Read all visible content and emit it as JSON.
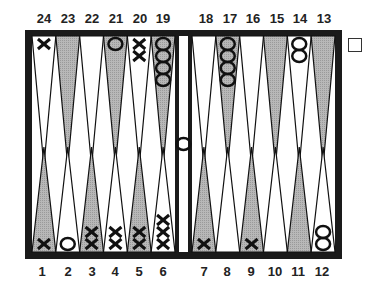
{
  "board": {
    "frame_color": "#1a1a1a",
    "shade_color": "#b8b8b8",
    "top_labels": [
      "24",
      "23",
      "22",
      "21",
      "20",
      "19",
      "18",
      "17",
      "16",
      "15",
      "14",
      "13"
    ],
    "bottom_labels": [
      "1",
      "2",
      "3",
      "4",
      "5",
      "6",
      "7",
      "8",
      "9",
      "10",
      "11",
      "12"
    ],
    "points": {
      "1": {
        "shade": "gray",
        "checker": "X",
        "count": 1
      },
      "2": {
        "shade": "white",
        "checker": "O",
        "count": 1
      },
      "3": {
        "shade": "gray",
        "checker": "X",
        "count": 2
      },
      "4": {
        "shade": "white",
        "checker": "X",
        "count": 2
      },
      "5": {
        "shade": "gray",
        "checker": "X",
        "count": 2
      },
      "6": {
        "shade": "white",
        "checker": "X",
        "count": 3
      },
      "7": {
        "shade": "gray",
        "checker": "X",
        "count": 1
      },
      "8": {
        "shade": "white",
        "checker": "",
        "count": 0
      },
      "9": {
        "shade": "gray",
        "checker": "X",
        "count": 1
      },
      "10": {
        "shade": "white",
        "checker": "",
        "count": 0
      },
      "11": {
        "shade": "gray",
        "checker": "",
        "count": 0
      },
      "12": {
        "shade": "white",
        "checker": "O",
        "count": 2
      },
      "13": {
        "shade": "gray",
        "checker": "",
        "count": 0
      },
      "14": {
        "shade": "white",
        "checker": "O",
        "count": 2
      },
      "15": {
        "shade": "gray",
        "checker": "",
        "count": 0
      },
      "16": {
        "shade": "white",
        "checker": "",
        "count": 0
      },
      "17": {
        "shade": "gray",
        "checker": "O",
        "count": 4
      },
      "18": {
        "shade": "white",
        "checker": "",
        "count": 0
      },
      "19": {
        "shade": "gray",
        "checker": "O",
        "count": 4
      },
      "20": {
        "shade": "white",
        "checker": "X",
        "count": 2
      },
      "21": {
        "shade": "gray",
        "checker": "O",
        "count": 1
      },
      "22": {
        "shade": "white",
        "checker": "",
        "count": 0
      },
      "23": {
        "shade": "gray",
        "checker": "",
        "count": 0
      },
      "24": {
        "shade": "white",
        "checker": "X",
        "count": 1
      }
    },
    "bar": {
      "checker": "O",
      "count": 1
    },
    "doubling_cube": {
      "value": ""
    }
  }
}
